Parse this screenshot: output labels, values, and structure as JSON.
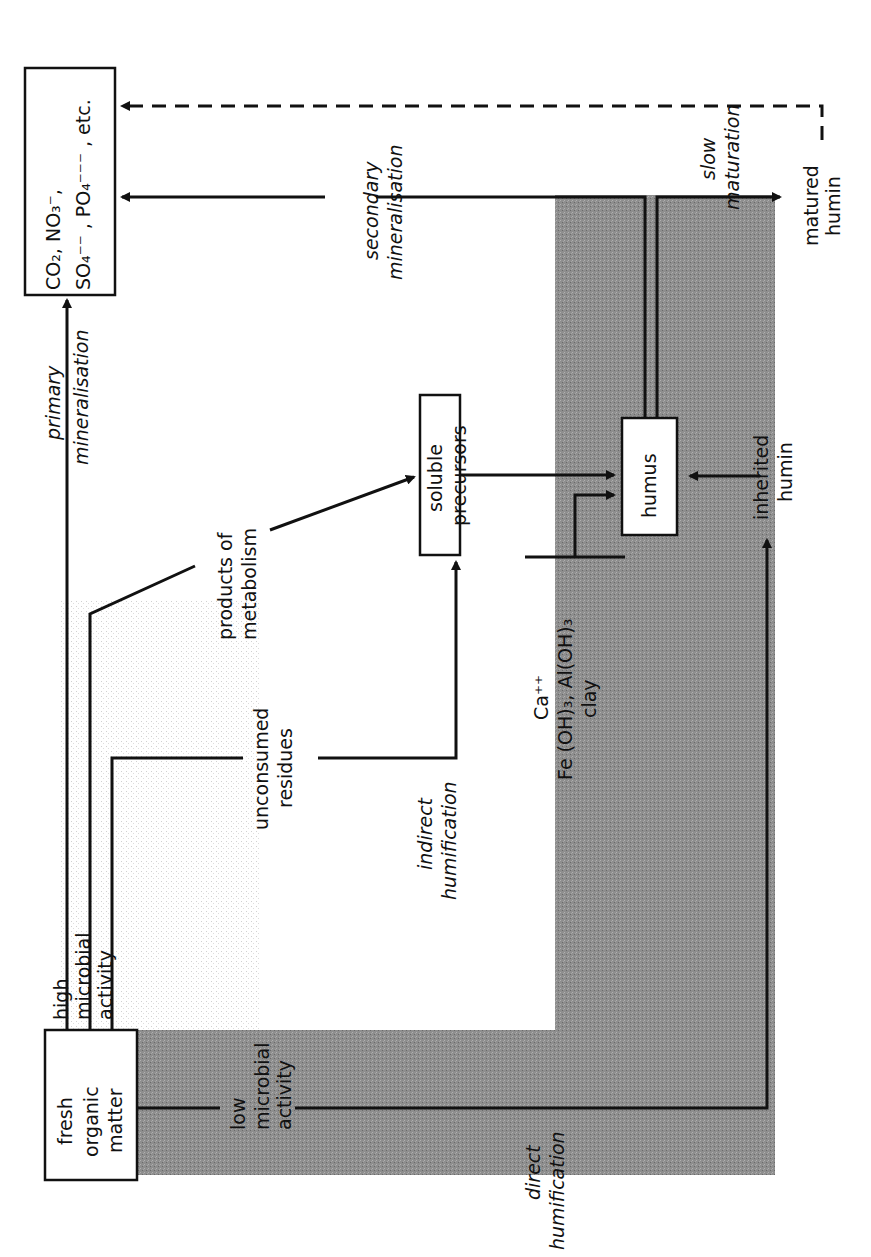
{
  "diagram": {
    "orientation": "rotated-90-counterclockwise",
    "nodes": {
      "fresh_organic_matter": [
        "fresh",
        "organic",
        "matter"
      ],
      "mineral_products": {
        "line1": "CO₂, NO₃⁻,",
        "line2": "SO₄⁻⁻ , PO₄⁻⁻⁻ , etc."
      },
      "soluble_precursors": [
        "soluble",
        "precursors"
      ],
      "humus": "humus",
      "matured_humin": [
        "matured",
        "humin"
      ],
      "inherited_humin": [
        "inherited",
        "humin"
      ]
    },
    "labels": {
      "high_microbial_activity": [
        "high",
        "microbial",
        "activity"
      ],
      "low_microbial_activity": [
        "low",
        "microbial",
        "activity"
      ],
      "primary_mineralisation": [
        "primary",
        "mineralisation"
      ],
      "secondary_mineralisation": [
        "secondary",
        "mineralisation"
      ],
      "products_of_metabolism": [
        "products of",
        "metabolism"
      ],
      "unconsumed_residues": [
        "unconsumed",
        "residues"
      ],
      "indirect_humification": [
        "indirect",
        "humification"
      ],
      "direct_humification": [
        "direct",
        "humification"
      ],
      "slow_maturation": [
        "slow",
        "maturation"
      ],
      "stabilisers": [
        "Ca⁺⁺",
        "Fe (OH)₃, Al(OH)₃",
        "clay"
      ]
    },
    "colors": {
      "band_dark": "#8a8a8a",
      "band_light": "#d4d4d4",
      "line": "#111111",
      "background": "#ffffff"
    }
  }
}
